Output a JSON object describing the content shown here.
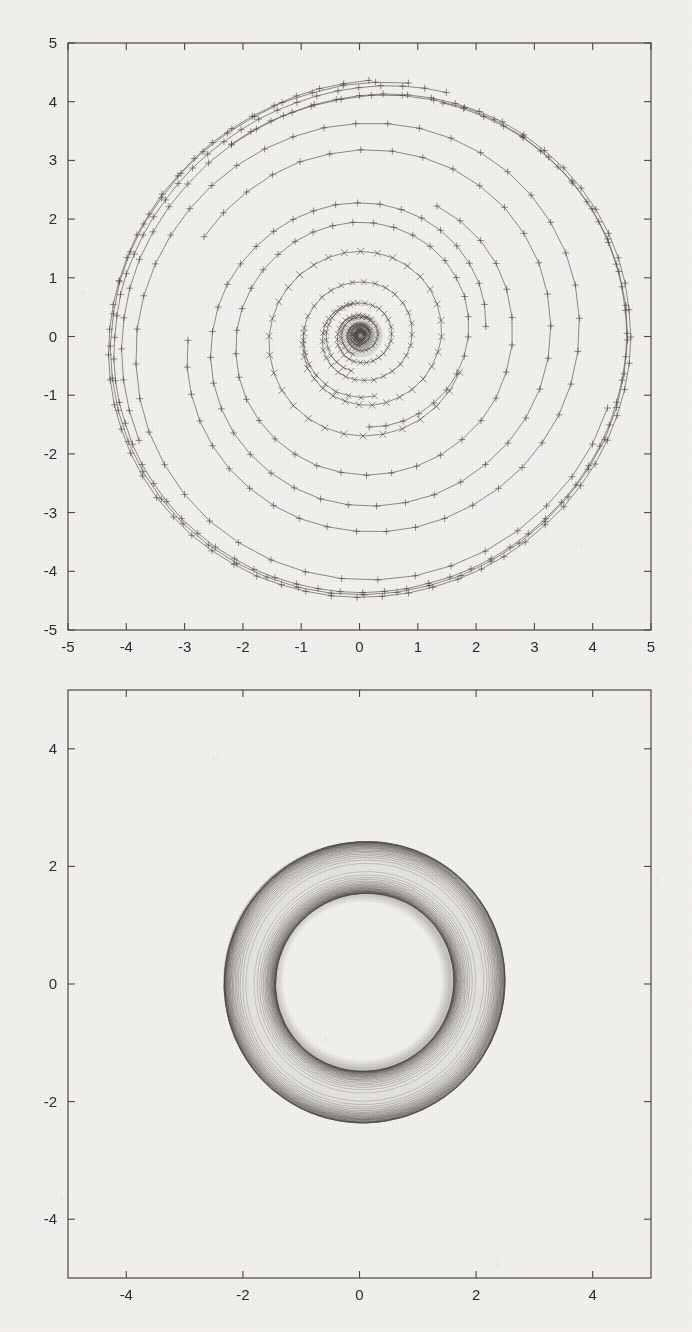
{
  "page": {
    "background_color": "#f2f0ee",
    "ink_color": "#4a4744"
  },
  "chart_data": [
    {
      "id": "top-plot",
      "type": "line",
      "title": "",
      "xlabel": "",
      "ylabel": "",
      "xlim": [
        -5,
        5
      ],
      "ylim": [
        -5,
        5
      ],
      "xticks": [
        -5,
        -4,
        -3,
        -2,
        -1,
        0,
        1,
        2,
        3,
        4,
        5
      ],
      "yticks": [
        -5,
        -4,
        -3,
        -2,
        -1,
        0,
        1,
        2,
        3,
        4,
        5
      ],
      "xticklabels": [
        "-5",
        "-4",
        "-3",
        "-2",
        "-1",
        "0",
        "1",
        "2",
        "3",
        "4",
        "5"
      ],
      "yticklabels": [
        "-5",
        "-4",
        "-3",
        "-2",
        "-1",
        "0",
        "1",
        "2",
        "3",
        "4",
        "5"
      ],
      "grid": false,
      "legend": "none",
      "frame": "box",
      "description": "Spiral trajectories of a planar dynamical system converging outward and inward onto a closed limit cycle of radius about 4.3; sample points marked with plus and cross markers.",
      "series": [
        {
          "name": "trajectory-outer-limit-cycle",
          "marker": "+",
          "r_start": 4.45,
          "r_end": 4.25,
          "turns": 1.0,
          "points": 72,
          "asym": 0.06
        },
        {
          "name": "trajectory-outer-b",
          "marker": "+",
          "r_start": 4.55,
          "r_end": 4.28,
          "turns": 1.1,
          "points": 70,
          "asym": 0.06
        },
        {
          "name": "trajectory-in-from-4p5",
          "marker": "+",
          "r_start": 4.5,
          "r_end": 4.22,
          "turns": 1.35,
          "points": 66,
          "asym": 0.055
        },
        {
          "name": "trajectory-out-from-3p6",
          "marker": "+",
          "r_start": 3.05,
          "r_end": 4.2,
          "turns": 1.45,
          "points": 60,
          "asym": 0.05
        },
        {
          "name": "trajectory-out-from-2p5",
          "marker": "+",
          "r_start": 2.05,
          "r_end": 3.35,
          "turns": 1.4,
          "points": 52,
          "asym": 0.045
        },
        {
          "name": "trajectory-out-from-2p0",
          "marker": "+",
          "r_start": 1.55,
          "r_end": 2.55,
          "turns": 1.4,
          "points": 48,
          "asym": 0.04
        },
        {
          "name": "trajectory-out-from-1p55",
          "marker": "x",
          "r_start": 1.0,
          "r_end": 1.75,
          "turns": 1.45,
          "points": 46,
          "asym": 0.035
        },
        {
          "name": "trajectory-out-from-0p95",
          "marker": "x",
          "r_start": 0.58,
          "r_end": 1.05,
          "turns": 1.5,
          "points": 44,
          "asym": 0.03
        },
        {
          "name": "trajectory-out-from-0p6",
          "marker": "x",
          "r_start": 0.32,
          "r_end": 0.62,
          "turns": 1.55,
          "points": 42,
          "asym": 0.025
        },
        {
          "name": "trajectory-core-a",
          "marker": "x",
          "r_start": 0.17,
          "r_end": 0.34,
          "turns": 1.6,
          "points": 40,
          "asym": 0.02
        },
        {
          "name": "trajectory-core-b",
          "marker": "x",
          "r_start": 0.09,
          "r_end": 0.18,
          "turns": 1.7,
          "points": 38,
          "asym": 0.015
        },
        {
          "name": "trajectory-core-c",
          "marker": "x",
          "r_start": 0.05,
          "r_end": 0.1,
          "turns": 1.8,
          "points": 34,
          "asym": 0.012
        }
      ]
    },
    {
      "id": "bottom-plot",
      "type": "line",
      "title": "",
      "xlabel": "",
      "ylabel": "",
      "xlim": [
        -5,
        5
      ],
      "ylim": [
        -5,
        5
      ],
      "xticks": [
        -4,
        -2,
        0,
        2,
        4
      ],
      "yticks": [
        -4,
        -2,
        0,
        2,
        4
      ],
      "xticklabels": [
        "-4",
        "-2",
        "0",
        "2",
        "4"
      ],
      "yticklabels": [
        "-4",
        "-2",
        "0",
        "2",
        "4"
      ],
      "grid": false,
      "legend": "none",
      "frame": "box",
      "description": "Dense family of nested closed orbits forming an annulus between radius about 1.5 and radius about 2.4, centred on the origin; inner and outer edges are darkest where orbits accumulate.",
      "annulus": {
        "inner_radius": 1.52,
        "outer_radius": 2.4,
        "center": [
          0.05,
          0.05
        ],
        "orbit_count": 46
      }
    }
  ]
}
